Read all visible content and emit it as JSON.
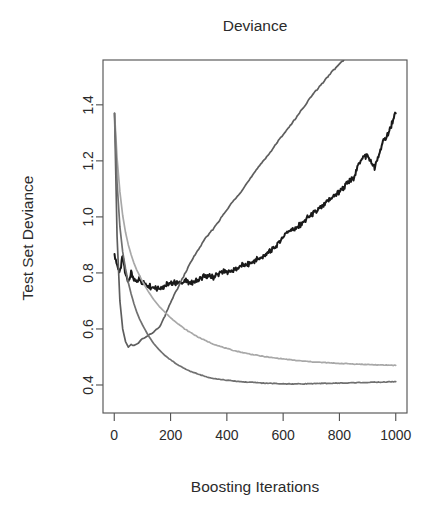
{
  "chart_data": {
    "type": "line",
    "title": "Deviance",
    "xlabel": "Boosting Iterations",
    "ylabel": "Test Set Deviance",
    "xlim": [
      -40,
      1040
    ],
    "ylim": [
      0.3,
      1.56
    ],
    "xticks": [
      0,
      200,
      400,
      600,
      800,
      1000
    ],
    "xticklabels": [
      "0",
      "200",
      "400",
      "600",
      "800",
      "1000"
    ],
    "yticks": [
      0.4,
      0.6,
      0.8,
      1.0,
      1.2,
      1.4
    ],
    "yticklabels": [
      "0.4",
      "0.6",
      "0.8",
      "1.0",
      "1.2",
      "1.4"
    ],
    "grid": false,
    "legend": "none",
    "box": "full",
    "x": [
      1,
      10,
      20,
      30,
      40,
      50,
      60,
      70,
      80,
      90,
      100,
      120,
      140,
      160,
      180,
      200,
      225,
      250,
      275,
      300,
      325,
      350,
      375,
      400,
      425,
      450,
      475,
      500,
      525,
      550,
      575,
      600,
      625,
      650,
      675,
      700,
      725,
      750,
      775,
      800,
      825,
      850,
      875,
      900,
      925,
      950,
      975,
      1000
    ],
    "series": [
      {
        "name": "black-noisy-curve",
        "color": "#1a1a1a",
        "width": 2.0,
        "values": [
          0.86,
          0.83,
          0.8,
          0.86,
          0.79,
          0.775,
          0.8,
          0.775,
          0.765,
          0.785,
          0.765,
          0.755,
          0.75,
          0.745,
          0.755,
          0.76,
          0.765,
          0.77,
          0.765,
          0.775,
          0.79,
          0.785,
          0.8,
          0.805,
          0.81,
          0.825,
          0.83,
          0.845,
          0.855,
          0.875,
          0.895,
          0.93,
          0.955,
          0.96,
          0.985,
          1.005,
          1.025,
          1.045,
          1.07,
          1.09,
          1.115,
          1.14,
          1.205,
          1.22,
          1.175,
          1.255,
          1.3,
          1.37
        ]
      },
      {
        "name": "dark-gray-overfit-curve",
        "color": "#5e5e5e",
        "width": 1.7,
        "values": [
          1.37,
          0.93,
          0.7,
          0.6,
          0.555,
          0.535,
          0.545,
          0.54,
          0.545,
          0.555,
          0.565,
          0.575,
          0.59,
          0.605,
          0.645,
          0.695,
          0.745,
          0.795,
          0.845,
          0.885,
          0.925,
          0.955,
          0.99,
          1.025,
          1.06,
          1.09,
          1.125,
          1.16,
          1.195,
          1.225,
          1.26,
          1.295,
          1.325,
          1.36,
          1.395,
          1.43,
          1.46,
          1.49,
          1.52,
          1.545,
          1.57,
          1.6,
          1.63,
          1.66,
          1.69,
          1.72,
          1.75,
          1.78
        ]
      },
      {
        "name": "light-gray-converged-curve",
        "color": "#a8a8a8",
        "width": 1.7,
        "values": [
          1.37,
          1.21,
          1.09,
          1.005,
          0.945,
          0.9,
          0.865,
          0.835,
          0.81,
          0.79,
          0.77,
          0.735,
          0.705,
          0.68,
          0.66,
          0.64,
          0.62,
          0.6,
          0.585,
          0.57,
          0.558,
          0.547,
          0.538,
          0.53,
          0.523,
          0.517,
          0.512,
          0.507,
          0.503,
          0.499,
          0.496,
          0.493,
          0.49,
          0.487,
          0.485,
          0.483,
          0.481,
          0.48,
          0.478,
          0.477,
          0.476,
          0.475,
          0.474,
          0.473,
          0.472,
          0.471,
          0.471,
          0.47
        ]
      },
      {
        "name": "medium-gray-converged-curve",
        "color": "#707070",
        "width": 1.7,
        "values": [
          1.37,
          1.12,
          0.965,
          0.875,
          0.815,
          0.765,
          0.725,
          0.69,
          0.66,
          0.635,
          0.615,
          0.578,
          0.548,
          0.525,
          0.505,
          0.49,
          0.472,
          0.458,
          0.447,
          0.438,
          0.43,
          0.424,
          0.42,
          0.417,
          0.414,
          0.412,
          0.41,
          0.409,
          0.407,
          0.406,
          0.405,
          0.404,
          0.404,
          0.404,
          0.404,
          0.405,
          0.405,
          0.406,
          0.406,
          0.407,
          0.407,
          0.408,
          0.409,
          0.409,
          0.41,
          0.41,
          0.411,
          0.412
        ]
      }
    ]
  }
}
